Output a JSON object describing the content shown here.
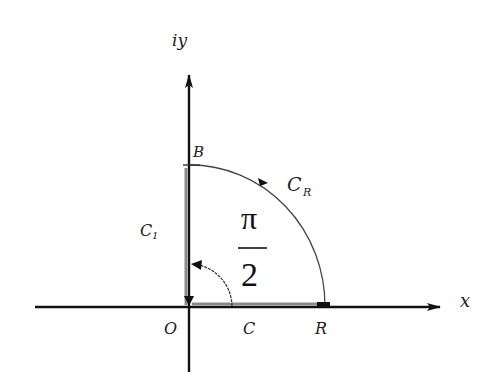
{
  "diagram": {
    "type": "complex-plane-contour",
    "axes": {
      "x_label": "x",
      "y_label": "iy",
      "origin_label": "O"
    },
    "points": {
      "B": "B",
      "R": "R"
    },
    "contours": {
      "arc_label_main": "C",
      "arc_label_sub": "R",
      "segment_label_main": "C",
      "segment_label_sub": "1",
      "small_arc_label": "C"
    },
    "angle": {
      "numerator": "π",
      "denominator": "2"
    },
    "colors": {
      "axis": "#111111",
      "contour_highlight": "#8a8a8a",
      "arc": "#333333"
    }
  }
}
